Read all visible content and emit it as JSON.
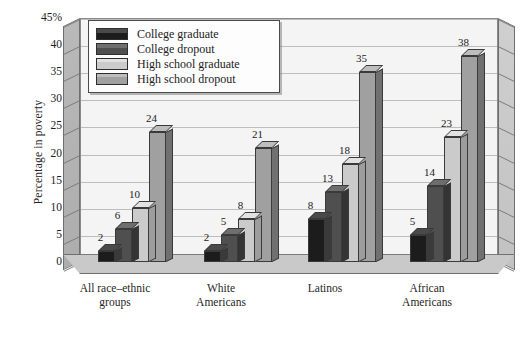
{
  "chart_data": {
    "type": "bar",
    "title": "",
    "subtitle": "",
    "xlabel": "",
    "ylabel": "Percentage in poverty",
    "ylim": [
      0,
      45
    ],
    "ytick_labels": [
      "45%",
      "40",
      "35",
      "30",
      "25",
      "20",
      "15",
      "10",
      "5",
      "0"
    ],
    "ytick_values": [
      45,
      40,
      35,
      30,
      25,
      20,
      15,
      10,
      5,
      0
    ],
    "grid": true,
    "legend_position": "top-left",
    "categories": [
      "All race–ethnic groups",
      "White Americans",
      "Latinos",
      "African Americans"
    ],
    "series": [
      {
        "name": "College graduate",
        "color": "#1c1c1c",
        "side_color": "#3a3a3a",
        "top_color": "#4a4a4a",
        "values": [
          2,
          2,
          8,
          5
        ]
      },
      {
        "name": "College dropout",
        "color": "#4f4f4f",
        "side_color": "#343434",
        "top_color": "#6e6e6e",
        "values": [
          6,
          5,
          13,
          14
        ]
      },
      {
        "name": "High school graduate",
        "color": "#cbcbcb",
        "side_color": "#9d9d9d",
        "top_color": "#e2e2e2",
        "values": [
          10,
          8,
          18,
          23
        ]
      },
      {
        "name": "High school dropout",
        "color": "#a0a0a0",
        "side_color": "#707070",
        "top_color": "#bdbdbd",
        "values": [
          24,
          21,
          35,
          38
        ]
      }
    ]
  },
  "legend": {
    "items": [
      {
        "label": "College graduate"
      },
      {
        "label": "College dropout"
      },
      {
        "label": "High school graduate"
      },
      {
        "label": "High school dropout"
      }
    ]
  },
  "axis": {
    "y_title": "Percentage in poverty"
  },
  "x_labels": [
    {
      "line1": "All race–ethnic",
      "line2": "groups"
    },
    {
      "line1": "White",
      "line2": "Americans"
    },
    {
      "line1": "Latinos",
      "line2": ""
    },
    {
      "line1": "African",
      "line2": "Americans"
    }
  ]
}
